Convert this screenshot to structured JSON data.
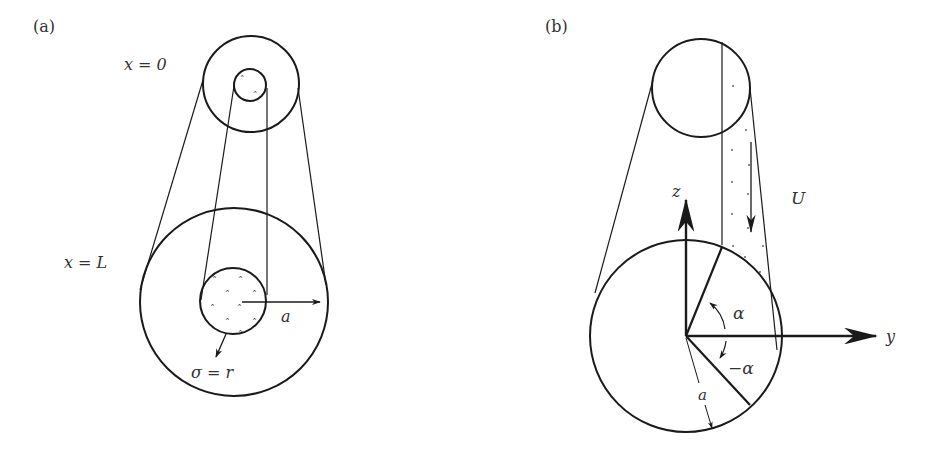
{
  "panels": [
    {
      "id": "a",
      "tag": "(a)",
      "labels": {
        "top_section": "x = 0",
        "bottom_section": "x = L",
        "radius": "a",
        "source": "σ = r"
      },
      "description": "Tapered tube: outer cross-section at x=0 and x=L, inner seeded core of radius growing along x"
    },
    {
      "id": "b",
      "tag": "(b)",
      "labels": {
        "z_axis": "z",
        "y_axis": "y",
        "velocity": "U",
        "angle_pos": "α",
        "angle_neg": "−α",
        "radius": "a"
      },
      "description": "Cross-section of cylinder with wedge sector between angles −α and α, uniform flow U along the cylinder"
    }
  ],
  "colors": {
    "stroke": "#1a1a1a",
    "text": "#333333",
    "background": "#ffffff"
  }
}
